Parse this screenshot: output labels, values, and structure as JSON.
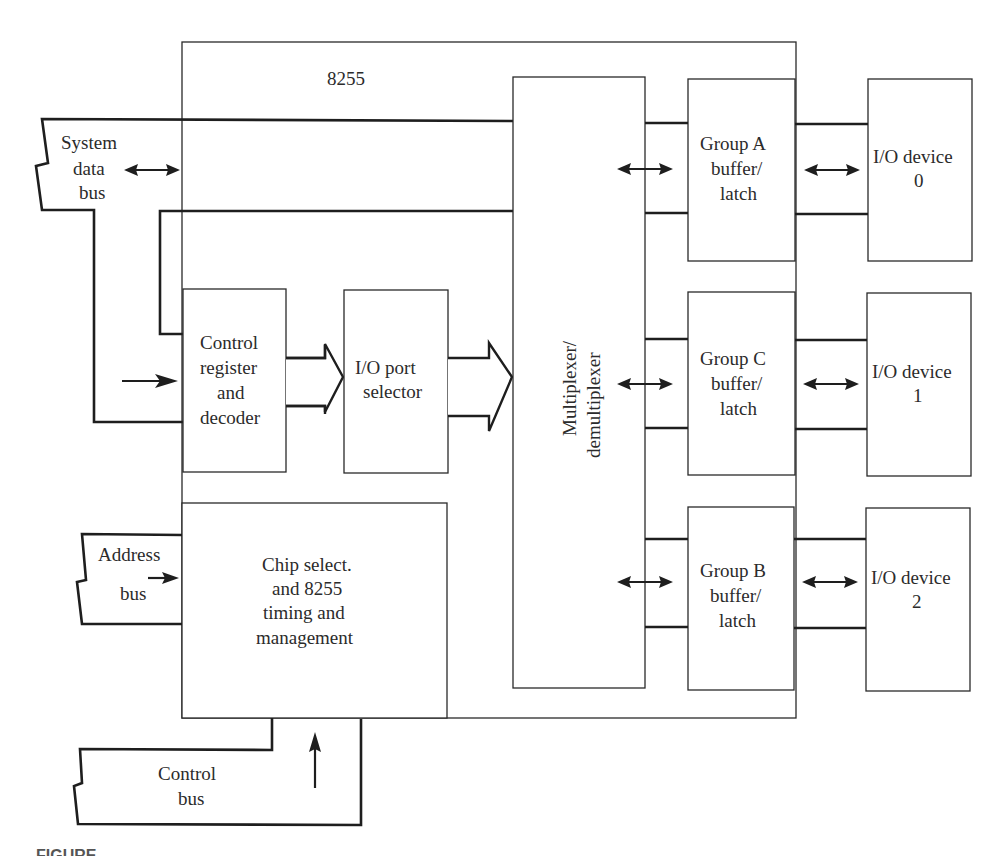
{
  "diagram": {
    "chip_label": "8255",
    "system_data_bus": [
      "System",
      "data",
      "bus"
    ],
    "address_bus": [
      "Address",
      "bus"
    ],
    "control_bus": [
      "Control",
      "bus"
    ],
    "control_register": [
      "Control",
      "register",
      "and",
      "decoder"
    ],
    "io_port_selector": [
      "I/O port",
      "selector"
    ],
    "multiplexer": [
      "Multiplexer/",
      "demultiplexer"
    ],
    "chip_select": [
      "Chip select.",
      "and 8255",
      "timing and",
      "management"
    ],
    "group_a": [
      "Group A",
      "buffer/",
      "latch"
    ],
    "group_c": [
      "Group C",
      "buffer/",
      "latch"
    ],
    "group_b": [
      "Group B",
      "buffer/",
      "latch"
    ],
    "io_device_0": [
      "I/O device",
      "0"
    ],
    "io_device_1": [
      "I/O device",
      "1"
    ],
    "io_device_2": [
      "I/O device",
      "2"
    ]
  },
  "caption": "FIGURE"
}
